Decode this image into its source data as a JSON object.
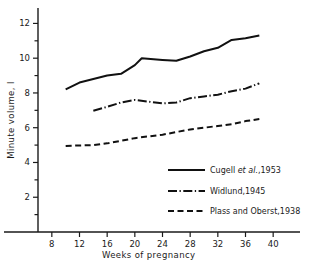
{
  "chart_data": {
    "type": "line",
    "title": "",
    "xlabel": "Weeks of pregnancy",
    "ylabel": "Minute volume, l",
    "xlim": [
      6,
      42
    ],
    "ylim": [
      0,
      12.6
    ],
    "xticks": [
      8,
      12,
      16,
      20,
      24,
      28,
      32,
      36,
      40
    ],
    "yticks": [
      2,
      4,
      6,
      8,
      10,
      12
    ],
    "yminorticks": [
      1,
      3,
      5,
      7,
      9,
      11
    ],
    "grid": false,
    "legend_position": "lower-right",
    "series": [
      {
        "name": "Cugell et al.,1953",
        "style": "solid",
        "x": [
          10,
          12,
          14,
          16,
          18,
          20,
          21,
          24,
          26,
          28,
          30,
          32,
          34,
          36,
          38
        ],
        "y": [
          8.2,
          8.6,
          8.8,
          9.0,
          9.1,
          9.6,
          10.0,
          9.9,
          9.85,
          10.1,
          10.4,
          10.6,
          11.05,
          11.15,
          11.3
        ]
      },
      {
        "name": "Widlund,1945",
        "style": "dashdot",
        "x": [
          14,
          16,
          18,
          20,
          22,
          24,
          26,
          28,
          30,
          32,
          34,
          36,
          38
        ],
        "y": [
          6.98,
          7.2,
          7.45,
          7.6,
          7.5,
          7.4,
          7.45,
          7.7,
          7.8,
          7.9,
          8.1,
          8.25,
          8.55
        ]
      },
      {
        "name": "Plass and Oberst,1938",
        "style": "dashed",
        "x": [
          10,
          12,
          14,
          16,
          18,
          20,
          22,
          24,
          26,
          28,
          30,
          32,
          34,
          36,
          38
        ],
        "y": [
          4.95,
          4.98,
          5.0,
          5.1,
          5.25,
          5.4,
          5.5,
          5.6,
          5.75,
          5.9,
          6.0,
          6.1,
          6.2,
          6.38,
          6.5
        ]
      }
    ]
  },
  "legend": {
    "entries": [
      {
        "label_pre": "Cugell ",
        "label_ital": "et al.",
        "label_post": ",1953",
        "style": "solid"
      },
      {
        "label_pre": "Widlund,1945",
        "label_ital": "",
        "label_post": "",
        "style": "dashdot"
      },
      {
        "label_pre": "Plass and Oberst,1938",
        "label_ital": "",
        "label_post": "",
        "style": "dashed"
      }
    ]
  }
}
